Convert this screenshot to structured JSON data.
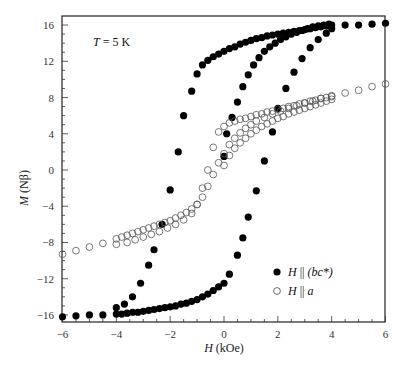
{
  "chart_data": {
    "type": "scatter",
    "title": "",
    "annotation": "T = 5 K",
    "xlabel": "H (kOe)",
    "ylabel": "M (Nβ)",
    "xlim": [
      -6,
      6
    ],
    "ylim": [
      -16.5,
      17
    ],
    "xticks": [
      -6,
      -4,
      -2,
      0,
      2,
      4,
      6
    ],
    "yticks": [
      -16,
      -12,
      -8,
      -4,
      0,
      4,
      8,
      12,
      16
    ],
    "grid": false,
    "legend_position": "lower right",
    "series": [
      {
        "name": "H || (bc*)",
        "marker": "filled-circle",
        "color": "#000000",
        "branches": [
          {
            "label": "initial",
            "x": [
              0,
              0.1,
              0.3,
              0.5,
              0.7,
              0.9,
              1.1,
              1.3,
              1.5,
              1.7,
              1.9,
              2.1,
              2.3,
              2.5,
              2.7,
              2.9,
              3.1,
              3.3,
              3.5,
              3.7,
              3.9
            ],
            "y": [
              1.5,
              4.0,
              5.8,
              7.5,
              9.2,
              10.5,
              11.6,
              12.4,
              13.1,
              13.6,
              14.0,
              14.4,
              14.7,
              15.0,
              15.2,
              15.4,
              15.6,
              15.8,
              15.9,
              16.0,
              16.1
            ]
          },
          {
            "label": "descending",
            "x": [
              6,
              5.5,
              5,
              4.5,
              4,
              3.8,
              3.6,
              3.4,
              3.2,
              3.0,
              2.8,
              2.6,
              2.4,
              2.2,
              2.0,
              1.8,
              1.6,
              1.4,
              1.2,
              1.0,
              0.8,
              0.6,
              0.4,
              0.2,
              0.0,
              -0.2,
              -0.4,
              -0.6,
              -0.8,
              -1.0,
              -1.2,
              -1.5,
              -1.7,
              -2.0,
              -2.3,
              -2.6,
              -2.8,
              -3.1,
              -3.4,
              -3.7,
              -4.0
            ],
            "y": [
              16.2,
              16.1,
              16.0,
              16.0,
              16.0,
              15.9,
              15.8,
              15.7,
              15.6,
              15.5,
              15.4,
              15.3,
              15.2,
              15.1,
              15.0,
              14.9,
              14.8,
              14.6,
              14.5,
              14.3,
              14.1,
              13.9,
              13.6,
              13.4,
              13.1,
              12.8,
              12.5,
              12.1,
              11.6,
              10.6,
              8.7,
              6.0,
              2.0,
              -2.2,
              -6.0,
              -8.8,
              -10.5,
              -12.5,
              -14.0,
              -14.8,
              -15.2
            ]
          },
          {
            "label": "ascending",
            "x": [
              -6,
              -5.5,
              -5,
              -4.5,
              -4,
              -3.8,
              -3.6,
              -3.4,
              -3.2,
              -3.0,
              -2.8,
              -2.6,
              -2.4,
              -2.2,
              -2.0,
              -1.8,
              -1.6,
              -1.4,
              -1.2,
              -1.0,
              -0.8,
              -0.6,
              -0.4,
              -0.2,
              0.0,
              0.2,
              0.5,
              0.7,
              0.9,
              1.2,
              1.5,
              1.8,
              2.0,
              2.3,
              2.6,
              2.9,
              3.2,
              3.5,
              3.8,
              4.0
            ],
            "y": [
              -16.2,
              -16.1,
              -16.0,
              -16.0,
              -15.9,
              -15.9,
              -15.8,
              -15.7,
              -15.7,
              -15.6,
              -15.5,
              -15.4,
              -15.3,
              -15.2,
              -15.1,
              -15.0,
              -14.8,
              -14.7,
              -14.5,
              -14.3,
              -14.0,
              -13.7,
              -13.3,
              -12.9,
              -12.5,
              -11.5,
              -9.4,
              -7.5,
              -5.2,
              -2.3,
              1.0,
              4.2,
              6.8,
              9.0,
              10.8,
              12.3,
              13.5,
              14.4,
              15.1,
              15.6
            ]
          }
        ]
      },
      {
        "name": "H || a",
        "marker": "open-circle",
        "color": "#000000",
        "branches": [
          {
            "label": "initial",
            "x": [
              0,
              0.2,
              0.4,
              0.6,
              0.8,
              1.0,
              1.2,
              1.4,
              1.6,
              1.8,
              2.0,
              2.2,
              2.4,
              2.6,
              2.8,
              3.0,
              3.2,
              3.4,
              3.6,
              3.8,
              4.0
            ],
            "y": [
              0.5,
              1.6,
              2.4,
              3.0,
              3.5,
              4.0,
              4.4,
              4.8,
              5.1,
              5.4,
              5.7,
              5.9,
              6.2,
              6.4,
              6.6,
              6.8,
              7.0,
              7.2,
              7.4,
              7.6,
              7.8
            ]
          },
          {
            "label": "descending",
            "x": [
              6,
              5.5,
              5,
              4.5,
              4,
              3.8,
              3.6,
              3.4,
              3.2,
              3.0,
              2.8,
              2.6,
              2.4,
              2.2,
              2.0,
              1.8,
              1.6,
              1.4,
              1.2,
              1.0,
              0.8,
              0.6,
              0.4,
              0.2,
              0.0,
              -0.2,
              -0.4,
              -0.6,
              -0.8,
              -1.0,
              -1.2,
              -1.5,
              -1.8,
              -2.1,
              -2.4,
              -2.7,
              -3.0,
              -3.3,
              -3.6,
              -4.0
            ],
            "y": [
              9.5,
              9.2,
              8.8,
              8.5,
              8.2,
              8.0,
              7.9,
              7.7,
              7.6,
              7.4,
              7.3,
              7.1,
              7.0,
              6.8,
              6.7,
              6.5,
              6.4,
              6.2,
              6.1,
              5.9,
              5.7,
              5.6,
              5.4,
              5.2,
              4.8,
              4.2,
              2.5,
              0.0,
              -2.0,
              -3.8,
              -4.8,
              -5.5,
              -6.0,
              -6.4,
              -6.8,
              -7.1,
              -7.4,
              -7.7,
              -8.0,
              -8.2
            ]
          },
          {
            "label": "ascending",
            "x": [
              -6,
              -5.5,
              -5,
              -4.5,
              -4,
              -3.8,
              -3.6,
              -3.4,
              -3.2,
              -3.0,
              -2.8,
              -2.6,
              -2.4,
              -2.2,
              -2.0,
              -1.8,
              -1.6,
              -1.4,
              -1.2,
              -1.0,
              -0.8,
              -0.6,
              -0.4,
              -0.2,
              0.0,
              0.2,
              0.4,
              0.6,
              0.8,
              1.0,
              1.2,
              1.5,
              1.8,
              2.1,
              2.4,
              2.7,
              3.0,
              3.3,
              3.6,
              4.0
            ],
            "y": [
              -9.3,
              -8.9,
              -8.5,
              -8.1,
              -7.6,
              -7.4,
              -7.2,
              -7.0,
              -6.8,
              -6.6,
              -6.4,
              -6.2,
              -6.0,
              -5.8,
              -5.6,
              -5.3,
              -5.0,
              -4.7,
              -4.3,
              -3.8,
              -3.0,
              -1.8,
              -0.5,
              0.8,
              1.8,
              2.8,
              3.5,
              4.1,
              4.6,
              5.0,
              5.4,
              5.8,
              6.2,
              6.5,
              6.8,
              7.1,
              7.4,
              7.6,
              7.9,
              8.1
            ]
          }
        ]
      }
    ]
  },
  "legend": {
    "items": [
      {
        "label_prefix": "H",
        "label_sym": " || ",
        "label_suffix": "(bc*)",
        "marker": "filled"
      },
      {
        "label_prefix": "H",
        "label_sym": " || ",
        "label_suffix": "a",
        "marker": "open"
      }
    ]
  },
  "labels": {
    "annotation_T": "T",
    "annotation_rest": " = 5 K",
    "ylabel_var": "M",
    "ylabel_unit": " (Nβ)",
    "xlabel_var": "H",
    "xlabel_unit": " (kOe)"
  }
}
